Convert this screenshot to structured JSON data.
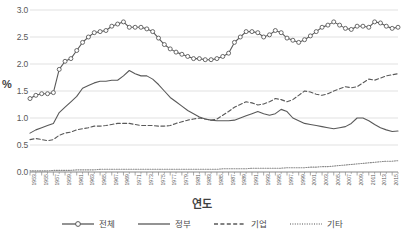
{
  "chart_data": {
    "type": "line",
    "title": "",
    "xlabel": "연도",
    "ylabel": "%",
    "ylim": [
      0.0,
      3.0
    ],
    "ytick_step": 0.5,
    "ytick_labels": [
      "0.0",
      "0.5",
      "1.0",
      "1.5",
      "2.0",
      "2.5",
      "3.0"
    ],
    "grid": "horizontal",
    "legend_position": "bottom",
    "xtick_labels": [
      "1953",
      "1955",
      "1957",
      "1959",
      "1961",
      "1963",
      "1965",
      "1967",
      "1969",
      "1971",
      "1973",
      "1975",
      "1977",
      "1979",
      "1981",
      "1983",
      "1985",
      "1987",
      "1989",
      "1991",
      "1993",
      "1995",
      "1997",
      "1999",
      "2001",
      "2003",
      "2005",
      "2007",
      "2009",
      "2011",
      "2013",
      "2015"
    ],
    "x": [
      1953,
      1954,
      1955,
      1956,
      1957,
      1958,
      1959,
      1960,
      1961,
      1962,
      1963,
      1964,
      1965,
      1966,
      1967,
      1968,
      1969,
      1970,
      1971,
      1972,
      1973,
      1974,
      1975,
      1976,
      1977,
      1978,
      1979,
      1980,
      1981,
      1982,
      1983,
      1984,
      1985,
      1986,
      1987,
      1988,
      1989,
      1990,
      1991,
      1992,
      1993,
      1994,
      1995,
      1996,
      1997,
      1998,
      1999,
      2000,
      2001,
      2002,
      2003,
      2004,
      2005,
      2006,
      2007,
      2008,
      2009,
      2010,
      2011,
      2012,
      2013,
      2014,
      2015,
      2016
    ],
    "series": [
      {
        "name": "전체",
        "style": "solid-marker",
        "color": "#595959",
        "values": [
          1.36,
          1.42,
          1.45,
          1.45,
          1.47,
          1.9,
          2.05,
          2.1,
          2.25,
          2.4,
          2.5,
          2.58,
          2.6,
          2.62,
          2.7,
          2.74,
          2.78,
          2.68,
          2.68,
          2.68,
          2.65,
          2.6,
          2.48,
          2.36,
          2.28,
          2.22,
          2.18,
          2.14,
          2.1,
          2.1,
          2.08,
          2.08,
          2.1,
          2.14,
          2.2,
          2.4,
          2.5,
          2.6,
          2.6,
          2.58,
          2.5,
          2.54,
          2.62,
          2.58,
          2.48,
          2.44,
          2.4,
          2.45,
          2.52,
          2.6,
          2.68,
          2.72,
          2.78,
          2.72,
          2.66,
          2.64,
          2.7,
          2.7,
          2.68,
          2.78,
          2.76,
          2.7,
          2.66,
          2.68
        ]
      },
      {
        "name": "정부",
        "style": "solid",
        "color": "#595959",
        "values": [
          0.72,
          0.78,
          0.82,
          0.86,
          0.9,
          1.1,
          1.2,
          1.3,
          1.4,
          1.55,
          1.6,
          1.65,
          1.68,
          1.68,
          1.7,
          1.7,
          1.78,
          1.88,
          1.82,
          1.78,
          1.78,
          1.72,
          1.62,
          1.5,
          1.38,
          1.3,
          1.22,
          1.14,
          1.08,
          1.02,
          0.98,
          0.96,
          0.95,
          0.95,
          0.95,
          0.96,
          1.0,
          1.04,
          1.08,
          1.12,
          1.08,
          1.05,
          1.08,
          1.16,
          1.12,
          1.0,
          0.95,
          0.9,
          0.88,
          0.86,
          0.84,
          0.82,
          0.8,
          0.82,
          0.84,
          0.9,
          1.0,
          1.0,
          0.95,
          0.88,
          0.82,
          0.78,
          0.75,
          0.76
        ]
      },
      {
        "name": "기업",
        "style": "dashed",
        "color": "#595959",
        "values": [
          0.6,
          0.62,
          0.6,
          0.58,
          0.6,
          0.68,
          0.72,
          0.74,
          0.78,
          0.8,
          0.82,
          0.85,
          0.85,
          0.86,
          0.88,
          0.9,
          0.9,
          0.9,
          0.88,
          0.86,
          0.86,
          0.86,
          0.85,
          0.85,
          0.86,
          0.9,
          0.93,
          0.96,
          0.98,
          1.0,
          0.98,
          0.96,
          0.98,
          1.05,
          1.12,
          1.2,
          1.25,
          1.3,
          1.28,
          1.24,
          1.26,
          1.3,
          1.36,
          1.34,
          1.3,
          1.34,
          1.42,
          1.5,
          1.48,
          1.44,
          1.42,
          1.45,
          1.5,
          1.54,
          1.58,
          1.56,
          1.58,
          1.65,
          1.72,
          1.7,
          1.74,
          1.78,
          1.8,
          1.82
        ]
      },
      {
        "name": "기타",
        "style": "dotted",
        "color": "#8a8a8a",
        "values": [
          0.02,
          0.02,
          0.02,
          0.02,
          0.03,
          0.03,
          0.03,
          0.03,
          0.04,
          0.04,
          0.04,
          0.04,
          0.05,
          0.05,
          0.05,
          0.05,
          0.05,
          0.05,
          0.05,
          0.05,
          0.05,
          0.05,
          0.05,
          0.05,
          0.05,
          0.05,
          0.05,
          0.05,
          0.05,
          0.05,
          0.05,
          0.05,
          0.05,
          0.06,
          0.06,
          0.06,
          0.06,
          0.06,
          0.07,
          0.07,
          0.07,
          0.07,
          0.07,
          0.07,
          0.08,
          0.08,
          0.08,
          0.08,
          0.09,
          0.09,
          0.1,
          0.1,
          0.11,
          0.12,
          0.13,
          0.14,
          0.15,
          0.16,
          0.17,
          0.18,
          0.19,
          0.2,
          0.2,
          0.21
        ]
      }
    ]
  },
  "axes": {
    "y_unit": "%",
    "x_title": "연도"
  },
  "legend": {
    "items": [
      {
        "label": "전체"
      },
      {
        "label": "정부"
      },
      {
        "label": "기업"
      },
      {
        "label": "기타"
      }
    ]
  },
  "colors": {
    "line": "#595959",
    "dotted_line": "#8a8a8a",
    "grid": "#d9d9d9",
    "axis": "#868686",
    "background": "#ffffff",
    "text": "#4a4a4a"
  }
}
